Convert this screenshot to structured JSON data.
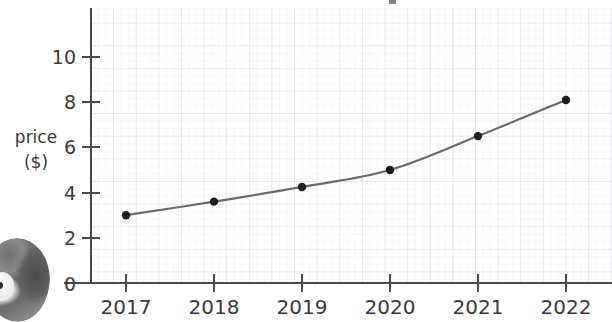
{
  "chart_data": {
    "type": "line",
    "title": "",
    "xlabel": "",
    "ylabel": "price\n($)",
    "ylabel_line1": "price",
    "ylabel_line2": "($)",
    "categories": [
      "2017",
      "2018",
      "2019",
      "2020",
      "2021",
      "2022"
    ],
    "x": [
      2017,
      2018,
      2019,
      2020,
      2021,
      2022
    ],
    "values": [
      3.0,
      3.6,
      4.25,
      5.0,
      6.5,
      8.1
    ],
    "series": [
      {
        "name": "price",
        "values": [
          3.0,
          3.6,
          4.25,
          5.0,
          6.5,
          8.1
        ]
      }
    ],
    "ylim": [
      0,
      11.6
    ],
    "y_ticks": [
      0,
      2,
      4,
      6,
      8,
      10
    ],
    "y_tick_labels": [
      "0",
      "2",
      "4",
      "6",
      "8",
      "10"
    ],
    "x_ticks": [
      2017,
      2018,
      2019,
      2020,
      2021,
      2022
    ],
    "x_tick_labels": [
      "2017",
      "2018",
      "2019",
      "2020",
      "2021",
      "2022"
    ],
    "grid": true,
    "grid_style": "graph-paper",
    "legend": false,
    "legend_position": "none",
    "marker": "circle",
    "colors": {
      "line": "#6a6a6a",
      "marker": "#1f1f1f",
      "axis": "#4a4a4a",
      "text": "#3a3a3a",
      "grid_minor": "#eceaf0",
      "grid_major": "#dcd9e2",
      "background": "#ffffff"
    }
  },
  "axes": {
    "y_axis_title_line1": "price",
    "y_axis_title_line2": "($)"
  },
  "decorations": {
    "corner_photo_alt": "cropped-photo-thumbnail"
  }
}
